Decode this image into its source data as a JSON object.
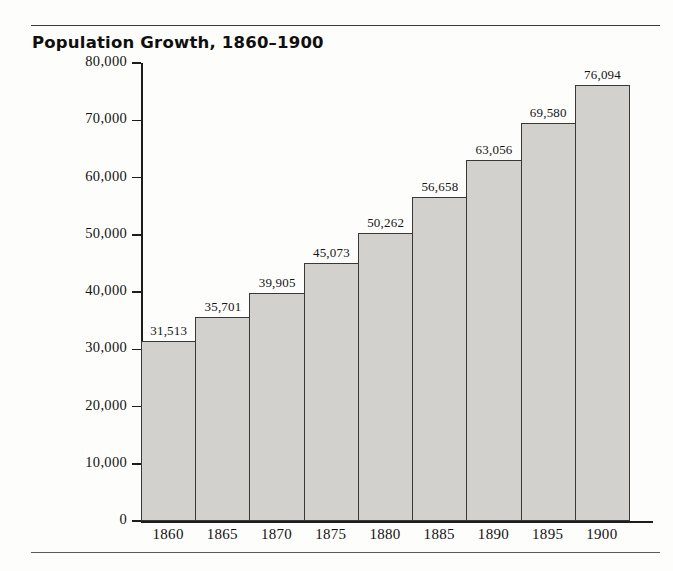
{
  "chart_data": {
    "type": "bar",
    "title": "Population Growth, 1860–1900",
    "xlabel": "",
    "ylabel": "Population (in thousands)",
    "categories": [
      "1860",
      "1865",
      "1870",
      "1875",
      "1880",
      "1885",
      "1890",
      "1895",
      "1900"
    ],
    "values": [
      31513,
      35701,
      39905,
      45073,
      50262,
      56658,
      63056,
      69580,
      76094
    ],
    "value_labels": [
      "31,513",
      "35,701",
      "39,905",
      "45,073",
      "50,262",
      "56,658",
      "63,056",
      "69,580",
      "76,094"
    ],
    "ylim": [
      0,
      80000
    ],
    "ytick_values": [
      0,
      10000,
      20000,
      30000,
      40000,
      50000,
      60000,
      70000,
      80000
    ],
    "ytick_labels": [
      "0",
      "10,000",
      "20,000",
      "30,000",
      "40,000",
      "50,000",
      "60,000",
      "70,000",
      "80,000"
    ],
    "grid": false,
    "legend": false,
    "bar_color": "#d2d1cd",
    "bar_border_color": "#3a3836",
    "axis_color": "#1e1d1c",
    "text_color": "#131211",
    "background": "#fdfdfc"
  }
}
